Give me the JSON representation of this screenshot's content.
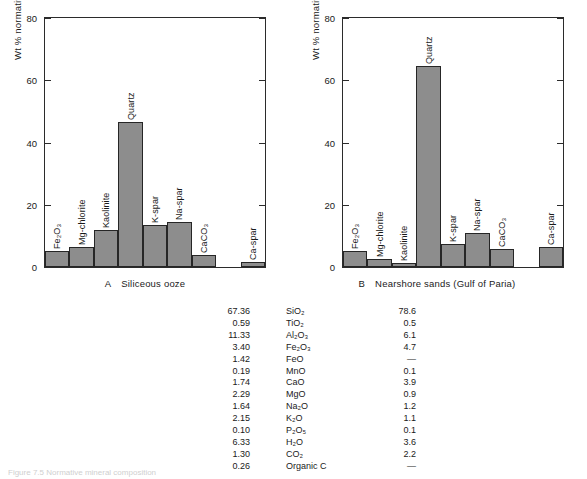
{
  "figure": {
    "caption": "Figure 7.5  Normative mineral composition",
    "bar_color": "#8d8d8d",
    "axis_color": "#262626"
  },
  "chart_data": [
    {
      "type": "bar",
      "panel_letter": "A",
      "title": "Siliceous ooze",
      "ylabel": "Wt % normative minerals",
      "xlabel": "",
      "ylim": [
        0,
        80
      ],
      "yticks": [
        0,
        20,
        40,
        60,
        80
      ],
      "grid": false,
      "legend": "none",
      "categories": [
        "Fe2O3",
        "Mg-chlorite",
        "Kaolinite",
        "Quartz",
        "K-spar",
        "Na-spar",
        "CaCO3",
        "",
        "Ca-spar"
      ],
      "category_labels": [
        "Fe₂O₃",
        "Mg-chlorite",
        "Kaolinite",
        "Quartz",
        "K-spar",
        "Na-spar",
        "CaCO₃",
        "",
        "Ca-spar"
      ],
      "values": [
        5.0,
        6.5,
        12.0,
        46.5,
        13.5,
        14.5,
        3.8,
        null,
        1.5
      ]
    },
    {
      "type": "bar",
      "panel_letter": "B",
      "title": "Nearshore sands (Gulf of Paria)",
      "ylabel": "Wt % normative minerals",
      "xlabel": "",
      "ylim": [
        0,
        80
      ],
      "yticks": [
        0,
        20,
        40,
        60,
        80
      ],
      "grid": false,
      "legend": "none",
      "categories": [
        "Fe2O3",
        "Mg-chlorite",
        "Kaolinite",
        "Quartz",
        "K-spar",
        "Na-spar",
        "CaCO3",
        "",
        "Ca-spar"
      ],
      "category_labels": [
        "Fe₂O₃",
        "Mg-chlorite",
        "Kaolinite",
        "Quartz",
        "K-spar",
        "Na-spar",
        "CaCO₃",
        "",
        "Ca-spar"
      ],
      "values": [
        5.2,
        2.6,
        1.4,
        64.5,
        7.5,
        11.0,
        5.7,
        null,
        6.4
      ]
    }
  ],
  "analyses": {
    "rows": [
      {
        "left": "67.36",
        "oxide": "SiO₂",
        "right": "78.6"
      },
      {
        "left": "0.59",
        "oxide": "TiO₂",
        "right": "0.5"
      },
      {
        "left": "11.33",
        "oxide": "Al₂O₃",
        "right": "6.1"
      },
      {
        "left": "3.40",
        "oxide": "Fe₂O₃",
        "right": "4.7"
      },
      {
        "left": "1.42",
        "oxide": "FeO",
        "right": "—"
      },
      {
        "left": "0.19",
        "oxide": "MnO",
        "right": "0.1"
      },
      {
        "left": "1.74",
        "oxide": "CaO",
        "right": "3.9"
      },
      {
        "left": "2.29",
        "oxide": "MgO",
        "right": "0.9"
      },
      {
        "left": "1.64",
        "oxide": "Na₂O",
        "right": "1.2"
      },
      {
        "left": "2.15",
        "oxide": "K₂O",
        "right": "1.1"
      },
      {
        "left": "0.10",
        "oxide": "P₂O₅",
        "right": "0.1"
      },
      {
        "left": "6.33",
        "oxide": "H₂O",
        "right": "3.6"
      },
      {
        "left": "1.30",
        "oxide": "CO₂",
        "right": "2.2"
      },
      {
        "left": "0.26",
        "oxide": "Organic C",
        "right": "—"
      }
    ]
  }
}
